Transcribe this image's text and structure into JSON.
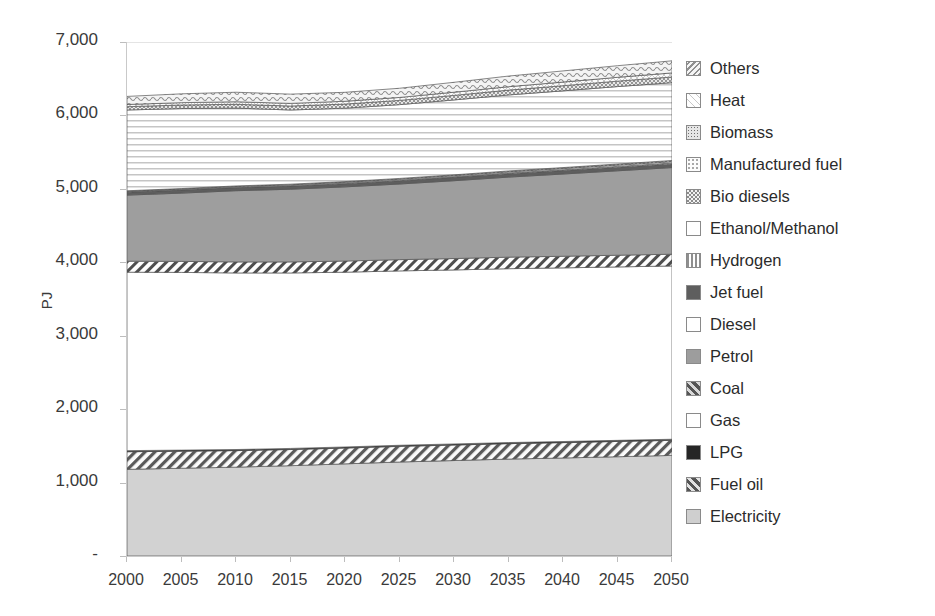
{
  "chart_data": {
    "type": "area",
    "title": "",
    "xlabel": "",
    "ylabel": "PJ",
    "x": [
      2000,
      2005,
      2010,
      2015,
      2020,
      2025,
      2030,
      2035,
      2040,
      2045,
      2050
    ],
    "xtick_labels": [
      "2000",
      "2005",
      "2010",
      "2015",
      "2020",
      "2025",
      "2030",
      "2035",
      "2040",
      "2045",
      "2050"
    ],
    "ytick_labels": [
      "7,000",
      "6,000",
      "5,000",
      "4,000",
      "3,000",
      "2,000",
      "1,000",
      "-"
    ],
    "ytick_values": [
      7000,
      6000,
      5000,
      4000,
      3000,
      2000,
      1000,
      0
    ],
    "ylim": [
      0,
      7000
    ],
    "xlim": [
      2000,
      2050
    ],
    "grid": true,
    "legend_position": "right",
    "stacking": "bottom-to-top",
    "stack_order": [
      "Electricity",
      "Fuel oil",
      "LPG",
      "Gas",
      "Coal",
      "Petrol",
      "Jet fuel",
      "Hydrogen",
      "Ethanol/Methanol",
      "Bio diesels",
      "Manufactured fuel",
      "Biomass",
      "Heat",
      "Others"
    ],
    "series": [
      {
        "name": "Electricity",
        "values": [
          1180,
          1195,
          1210,
          1230,
          1255,
          1280,
          1300,
          1320,
          1335,
          1352,
          1370
        ]
      },
      {
        "name": "Fuel oil",
        "values": [
          240,
          232,
          225,
          220,
          215,
          213,
          211,
          210,
          209,
          208,
          205
        ]
      },
      {
        "name": "LPG",
        "values": [
          15,
          15,
          15,
          15,
          15,
          15,
          15,
          15,
          15,
          15,
          15
        ]
      },
      {
        "name": "Gas",
        "values": [
          2430,
          2420,
          2405,
          2390,
          2380,
          2375,
          2370,
          2368,
          2365,
          2362,
          2360
        ]
      },
      {
        "name": "Coal",
        "values": [
          150,
          150,
          150,
          150,
          152,
          153,
          155,
          157,
          158,
          159,
          160
        ]
      },
      {
        "name": "Petrol",
        "values": [
          900,
          930,
          970,
          990,
          1010,
          1030,
          1060,
          1090,
          1120,
          1150,
          1180
        ]
      },
      {
        "name": "Jet fuel",
        "values": [
          40,
          41,
          42,
          43,
          44,
          45,
          46,
          47,
          48,
          49,
          50
        ]
      },
      {
        "name": "Hydrogen",
        "values": [
          5,
          5,
          5,
          6,
          6,
          7,
          8,
          9,
          10,
          11,
          12
        ]
      },
      {
        "name": "Ethanol/Methanol",
        "values": [
          8,
          9,
          10,
          11,
          12,
          13,
          14,
          15,
          16,
          17,
          18
        ]
      },
      {
        "name": "Bio diesels",
        "values": [
          6,
          7,
          8,
          9,
          10,
          11,
          12,
          13,
          14,
          15,
          16
        ]
      },
      {
        "name": "Manufactured fuel",
        "values": [
          1100,
          1090,
          1060,
          1010,
          1000,
          1005,
          1020,
          1035,
          1045,
          1055,
          1060
        ]
      },
      {
        "name": "Biomass",
        "values": [
          45,
          48,
          52,
          54,
          56,
          58,
          62,
          66,
          70,
          74,
          78
        ]
      },
      {
        "name": "Heat",
        "values": [
          30,
          32,
          34,
          36,
          38,
          40,
          43,
          46,
          49,
          52,
          55
        ]
      },
      {
        "name": "Others",
        "values": [
          110,
          120,
          130,
          126,
          122,
          125,
          135,
          145,
          152,
          158,
          165
        ]
      }
    ],
    "cumulative_totals": [
      6259,
      6294,
      6316,
      6290,
      6315,
      6370,
      6451,
      6536,
      6606,
      6677,
      6744
    ]
  },
  "axis": {
    "y_title": "PJ"
  },
  "legend": {
    "items": [
      {
        "label": "Others",
        "pattern": "wave",
        "color": "#a8a8a8"
      },
      {
        "label": "Heat",
        "pattern": "cross-light",
        "color": "#d0d0d0"
      },
      {
        "label": "Biomass",
        "pattern": "dots-dense",
        "color": "#909090"
      },
      {
        "label": "Manufactured fuel",
        "pattern": "dots-sparse",
        "color": "#dcdcdc"
      },
      {
        "label": "Bio diesels",
        "pattern": "checker",
        "color": "#9a9a9a"
      },
      {
        "label": "Ethanol/Methanol",
        "pattern": "solid",
        "color": "#ffffff"
      },
      {
        "label": "Hydrogen",
        "pattern": "vertical",
        "color": "#c4c4c4"
      },
      {
        "label": "Jet fuel",
        "pattern": "solid",
        "color": "#5e5e5e"
      },
      {
        "label": "Diesel",
        "pattern": "solid",
        "color": "#ffffff"
      },
      {
        "label": "Petrol",
        "pattern": "solid",
        "color": "#9d9d9d"
      },
      {
        "label": "Coal",
        "pattern": "diagonal",
        "color": "#d8d8d8"
      },
      {
        "label": "Gas",
        "pattern": "solid",
        "color": "#ffffff"
      },
      {
        "label": "LPG",
        "pattern": "solid",
        "color": "#262626"
      },
      {
        "label": "Fuel oil",
        "pattern": "diagonal",
        "color": "#e2e2e2"
      },
      {
        "label": "Electricity",
        "pattern": "solid",
        "color": "#cfcfcf"
      }
    ]
  }
}
